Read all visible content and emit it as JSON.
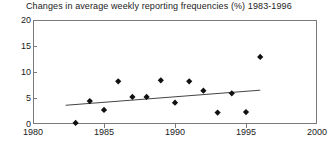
{
  "chart_data": {
    "type": "scatter",
    "title": "Changes in average weekly reporting frequencies (%) 1983-1996",
    "xlabel": "",
    "ylabel": "",
    "xlim": [
      1980,
      2000
    ],
    "ylim": [
      0,
      20
    ],
    "xticks": [
      1980,
      1985,
      1990,
      1995,
      2000
    ],
    "yticks": [
      0,
      5,
      10,
      15,
      20
    ],
    "grid": false,
    "legend": "none",
    "marker_shape": "diamond",
    "marker_color": "#111111",
    "series": [
      {
        "name": "Change in average weekly reporting frequency",
        "x": [
          1983,
          1984,
          1985,
          1986,
          1987,
          1988,
          1989,
          1990,
          1991,
          1992,
          1993,
          1994,
          1995,
          1996
        ],
        "values": [
          0.2,
          4.4,
          2.7,
          8.2,
          5.2,
          5.2,
          8.4,
          4.1,
          8.2,
          6.4,
          2.2,
          5.9,
          2.3,
          12.9
        ]
      }
    ],
    "trendline": {
      "name": "linear trend",
      "x": [
        1982.3,
        1996.0
      ],
      "y": [
        3.6,
        6.5
      ],
      "color": "#444444"
    }
  },
  "axis": {
    "x_tick_labels": [
      "1980",
      "1985",
      "1990",
      "1995",
      "2000"
    ],
    "y_tick_labels": [
      "0",
      "5",
      "10",
      "15",
      "20"
    ]
  }
}
